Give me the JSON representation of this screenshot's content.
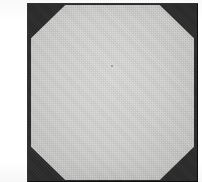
{
  "figure": {
    "caption": "",
    "background_color": "#ffffff",
    "shapes": {
      "plate": {
        "name": "square-plate",
        "shape": "square",
        "fill_color": "#2b2b2b",
        "outline_color": "#0a0a0a"
      },
      "octagon": {
        "name": "octagon",
        "shape": "regular-octagon",
        "sides": 8,
        "fill_color": "#d6d6d4",
        "texture": "paper-grain"
      }
    },
    "margins": {
      "left_margin_color": "#ffffff",
      "top_margin_color": "#ffffff"
    }
  }
}
